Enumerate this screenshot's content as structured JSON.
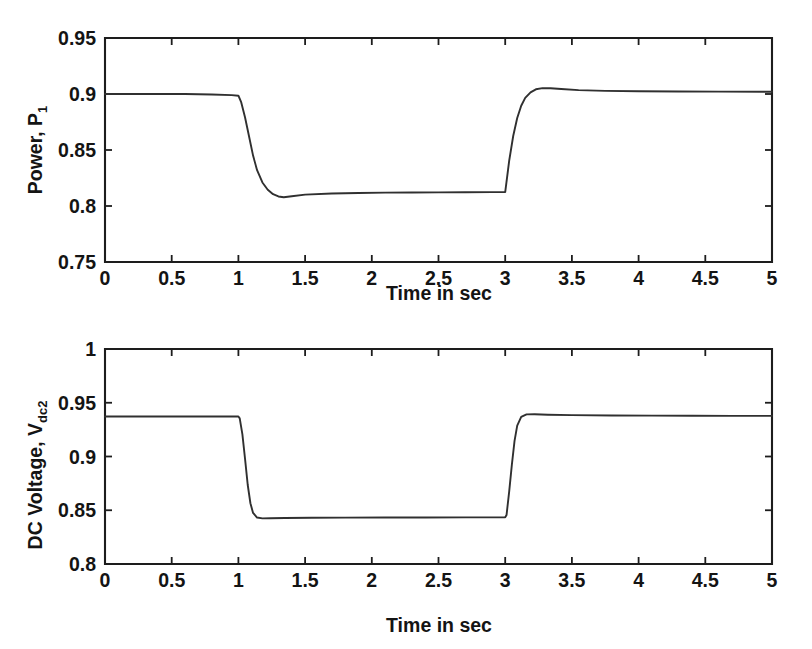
{
  "figure": {
    "background": "#ffffff",
    "line_color": "#303030",
    "axis_color": "#1d1d1d",
    "text_color": "#141414"
  },
  "panels": [
    {
      "id": "power",
      "ylabel_main": "Power, P",
      "ylabel_sub": "1",
      "xlabel": "Time in sec"
    },
    {
      "id": "vdc",
      "ylabel_main": "DC Voltage, V",
      "ylabel_sub": "dc2",
      "xlabel": "Time in sec"
    }
  ],
  "chart_data": [
    {
      "type": "line",
      "title": "",
      "xlabel": "Time in sec",
      "ylabel": "Power, P1",
      "xlim": [
        0,
        5
      ],
      "ylim": [
        0.75,
        0.95
      ],
      "xticks": [
        0,
        0.5,
        1,
        1.5,
        2,
        2.5,
        3,
        3.5,
        4,
        4.5,
        5
      ],
      "xticklabels": [
        "0",
        "0.5",
        "1",
        "1.5",
        "2",
        "2.5",
        "3",
        "3.5",
        "4",
        "4.5",
        "5"
      ],
      "yticks": [
        0.75,
        0.8,
        0.85,
        0.9,
        0.95
      ],
      "yticklabels": [
        "0.75",
        "0.8",
        "0.85",
        "0.9",
        "0.95"
      ],
      "grid": false,
      "legend": "none",
      "series": [
        {
          "name": "P1",
          "x": [
            0.0,
            0.2,
            0.4,
            0.6,
            0.8,
            0.95,
            1.0,
            1.02,
            1.05,
            1.08,
            1.11,
            1.14,
            1.18,
            1.22,
            1.26,
            1.3,
            1.34,
            1.4,
            1.5,
            1.7,
            1.9,
            2.1,
            2.3,
            2.5,
            2.7,
            2.9,
            2.99,
            3.0,
            3.03,
            3.06,
            3.09,
            3.12,
            3.15,
            3.19,
            3.23,
            3.28,
            3.34,
            3.42,
            3.55,
            3.75,
            4.0,
            4.3,
            4.6,
            5.0
          ],
          "y": [
            0.9,
            0.9,
            0.9,
            0.9,
            0.8995,
            0.899,
            0.8985,
            0.893,
            0.879,
            0.862,
            0.845,
            0.832,
            0.821,
            0.8145,
            0.8105,
            0.8085,
            0.8078,
            0.8087,
            0.8102,
            0.8111,
            0.8116,
            0.8119,
            0.8121,
            0.8122,
            0.8123,
            0.8124,
            0.8124,
            0.8124,
            0.8405,
            0.8625,
            0.8785,
            0.8895,
            0.8965,
            0.9015,
            0.9042,
            0.9052,
            0.9052,
            0.9045,
            0.9035,
            0.9028,
            0.9024,
            0.9022,
            0.9021,
            0.902
          ]
        }
      ]
    },
    {
      "type": "line",
      "title": "",
      "xlabel": "Time in sec",
      "ylabel": "DC Voltage, Vdc2",
      "xlim": [
        0,
        5
      ],
      "ylim": [
        0.8,
        1.0
      ],
      "xticks": [
        0,
        0.5,
        1,
        1.5,
        2,
        2.5,
        3,
        3.5,
        4,
        4.5,
        5
      ],
      "xticklabels": [
        "0",
        "0.5",
        "1",
        "1.5",
        "2",
        "2.5",
        "3",
        "3.5",
        "4",
        "4.5",
        "5"
      ],
      "yticks": [
        0.8,
        0.85,
        0.9,
        0.95,
        1
      ],
      "yticklabels": [
        "0.8",
        "0.85",
        "0.9",
        "0.95",
        "1"
      ],
      "grid": false,
      "legend": "none",
      "series": [
        {
          "name": "Vdc2",
          "x": [
            0.0,
            0.3,
            0.6,
            0.9,
            1.0,
            1.01,
            1.03,
            1.05,
            1.07,
            1.09,
            1.11,
            1.14,
            1.18,
            1.24,
            1.35,
            1.55,
            1.8,
            2.1,
            2.4,
            2.7,
            2.95,
            3.0,
            3.01,
            3.03,
            3.05,
            3.07,
            3.09,
            3.12,
            3.16,
            3.22,
            3.32,
            3.5,
            3.8,
            4.1,
            4.4,
            4.7,
            5.0
          ],
          "y": [
            0.9372,
            0.9372,
            0.9372,
            0.9372,
            0.9372,
            0.9355,
            0.9205,
            0.8975,
            0.8735,
            0.8565,
            0.8475,
            0.8432,
            0.8424,
            0.8426,
            0.8428,
            0.843,
            0.8431,
            0.8432,
            0.8433,
            0.8434,
            0.8434,
            0.8434,
            0.8455,
            0.8675,
            0.8925,
            0.9145,
            0.9288,
            0.9368,
            0.9392,
            0.9393,
            0.9389,
            0.9385,
            0.9382,
            0.938,
            0.9379,
            0.9378,
            0.9378
          ]
        }
      ]
    }
  ]
}
